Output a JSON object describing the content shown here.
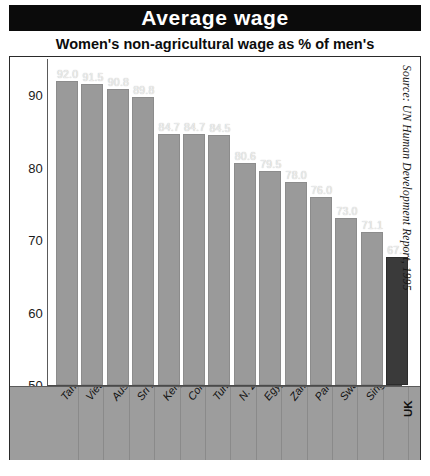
{
  "header": {
    "title": "Average wage",
    "subtitle": "Women's non-agricultural wage as % of men's"
  },
  "source_note": "Source: UN Human Development Report, 1995",
  "colors": {
    "banner_background": "#0b0b0b",
    "banner_text": "#ffffff",
    "bar": "#9a9a9a",
    "bar_highlight": "#3a3a3a",
    "axis_band": "#9d9d9d",
    "frame_border": "#2a2a2a"
  },
  "chart_data": {
    "type": "bar",
    "title": "Average wage",
    "subtitle": "Women's non-agricultural wage as % of men's",
    "xlabel": "",
    "ylabel": "",
    "ylim": [
      50,
      95
    ],
    "yticks": [
      50,
      60,
      70,
      80,
      90
    ],
    "grid": false,
    "legend": "none",
    "highlight_category": "UK",
    "categories": [
      "Tanzania",
      "Vietnam",
      "Australia",
      "Sri Lanka",
      "Kenya",
      "Colombia",
      "Turkey",
      "N. Zealand",
      "Egypt",
      "Zambia",
      "Paraguay",
      "Swaziland",
      "Singapore",
      "UK"
    ],
    "values": [
      92.0,
      91.5,
      90.8,
      89.8,
      84.7,
      84.7,
      84.5,
      80.6,
      79.5,
      78.0,
      76.0,
      73.0,
      71.1,
      67.7
    ],
    "value_labels": [
      "92.0",
      "91.5",
      "90.8",
      "89.8",
      "84.7",
      "84.7",
      "84.5",
      "80.6",
      "79.5",
      "78.0",
      "76.0",
      "73.0",
      "71.1",
      "67.7"
    ]
  }
}
